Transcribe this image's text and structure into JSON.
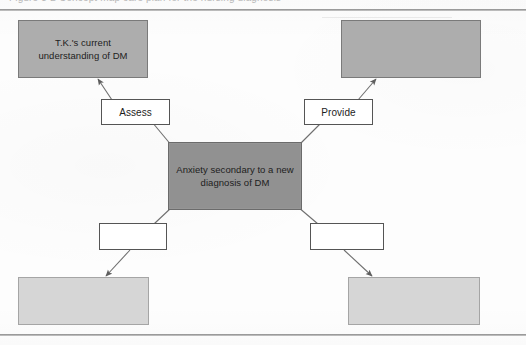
{
  "figure": {
    "caption_cutoff": "Figure 3-2 Concept map care plan for the nursing diagnosis",
    "type": "concept-map"
  },
  "nodes": {
    "center": {
      "label": "Anxiety secondary to a new diagnosis of DM",
      "fill": "#919191"
    },
    "top_left": {
      "label": "T.K.'s current understanding of DM",
      "fill": "#adadad"
    },
    "top_right": {
      "label": "",
      "fill": "#adadad"
    },
    "bottom_left": {
      "label": "",
      "fill": "#d6d6d6"
    },
    "bottom_right": {
      "label": "",
      "fill": "#d6d6d6"
    }
  },
  "link_labels": {
    "upper_left": "Assess",
    "upper_right": "Provide",
    "lower_left": "",
    "lower_right": ""
  },
  "colors": {
    "rule": "#9a9a9a",
    "node_border_dark": "#6b6b6b",
    "node_border_light": "#a5a5a5",
    "connector": "#6e6e6e",
    "text": "#1d1d1d",
    "page_background": "#fdfdfd"
  }
}
